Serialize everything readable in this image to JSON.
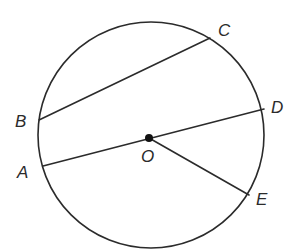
{
  "diagram": {
    "type": "circle-geometry",
    "canvas": {
      "width": 305,
      "height": 249,
      "background": "#ffffff"
    },
    "colors": {
      "stroke": "#2b2b2b",
      "text": "#2b2b2b"
    },
    "circle": {
      "cx": 151,
      "cy": 135,
      "r": 113
    },
    "center": {
      "name": "O",
      "x": 149,
      "y": 138,
      "dot_radius": 4
    },
    "points": {
      "A": {
        "x": 43,
        "y": 166
      },
      "B": {
        "x": 39,
        "y": 120
      },
      "C": {
        "x": 210,
        "y": 38
      },
      "D": {
        "x": 264,
        "y": 109
      },
      "E": {
        "x": 249,
        "y": 195
      }
    },
    "segments": [
      {
        "name": "chord-BC",
        "from": "B",
        "to": "C"
      },
      {
        "name": "diameter-AD",
        "from": "A",
        "to": "D"
      },
      {
        "name": "radius-OE",
        "from": "O",
        "to": "E"
      }
    ],
    "labels": {
      "A": {
        "text": "A",
        "x": 17,
        "y": 178
      },
      "B": {
        "text": "B",
        "x": 15,
        "y": 127
      },
      "C": {
        "text": "C",
        "x": 218,
        "y": 36
      },
      "D": {
        "text": "D",
        "x": 271,
        "y": 113
      },
      "E": {
        "text": "E",
        "x": 256,
        "y": 205
      },
      "O": {
        "text": "O",
        "x": 141,
        "y": 162
      }
    }
  }
}
